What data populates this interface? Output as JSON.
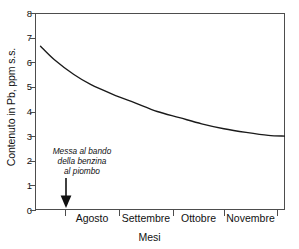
{
  "chart_data": {
    "type": "line",
    "title": "",
    "xlabel": "Mesi",
    "ylabel": "Contenuto in Pb, ppm s.s.",
    "ylim": [
      0,
      8
    ],
    "yticks": [
      8,
      7,
      6,
      5,
      4,
      3,
      2,
      1,
      0
    ],
    "grid": false,
    "legend": null,
    "categories": [
      "Agosto",
      "Settembre",
      "Ottobre",
      "Novembre"
    ],
    "series": [
      {
        "name": "Contenuto in Pb",
        "points": [
          {
            "x": 0.1,
            "y": 6.65
          },
          {
            "x": 0.35,
            "y": 6.1
          },
          {
            "x": 0.7,
            "y": 5.5
          },
          {
            "x": 1.0,
            "y": 5.1
          },
          {
            "x": 1.4,
            "y": 4.7
          },
          {
            "x": 1.8,
            "y": 4.35
          },
          {
            "x": 2.2,
            "y": 4.0
          },
          {
            "x": 2.6,
            "y": 3.75
          },
          {
            "x": 3.0,
            "y": 3.5
          },
          {
            "x": 3.4,
            "y": 3.3
          },
          {
            "x": 3.8,
            "y": 3.15
          },
          {
            "x": 4.2,
            "y": 3.03
          },
          {
            "x": 4.5,
            "y": 3.0
          }
        ]
      }
    ],
    "annotations": [
      {
        "name": "ban-marker",
        "lines": [
          "Messa al bando",
          "della benzina",
          "al piombo"
        ],
        "arrow": "down",
        "x_category_boundary": "start-of-Agosto"
      }
    ]
  },
  "axes": {
    "y_tick_labels": [
      "8",
      "7",
      "6",
      "5",
      "4",
      "3",
      "2",
      "1",
      "0"
    ],
    "x_tick_labels": [
      "Agosto",
      "Settembre",
      "Ottobre",
      "Novembre"
    ],
    "y_axis_title": "Contenuto in Pb, ppm s.s.",
    "x_axis_title": "Mesi"
  },
  "annotation": {
    "line1": "Messa al bando",
    "line2": "della benzina",
    "line3": "al piombo"
  },
  "colors": {
    "axis": "#4d4d4d",
    "curve": "#1a1a1a",
    "text": "#111111",
    "background": "#ffffff"
  }
}
